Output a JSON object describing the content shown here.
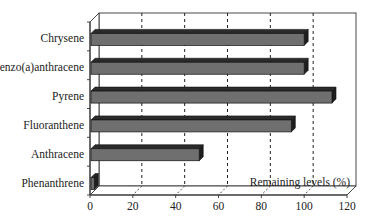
{
  "chart_data": {
    "type": "bar",
    "orientation": "horizontal",
    "style": "3d",
    "title": "",
    "categories": [
      "Chrysene",
      "Benzo(a)anthracene",
      "Pyrene",
      "Fluoranthene",
      "Anthracene",
      "Phenanthrene"
    ],
    "values": [
      100,
      100,
      113,
      94,
      51,
      2
    ],
    "xlabel": "Remaining levels (%)",
    "ylabel": "",
    "xlim": [
      0,
      120
    ],
    "xticks": [
      0,
      20,
      40,
      60,
      80,
      100,
      120
    ],
    "grid": "vertical dashed",
    "legend": null,
    "colors": {
      "bar_face": "#6f6f6f",
      "bar_top": "#2b2b2b",
      "bar_side": "#1e1e1e",
      "axis": "#333333",
      "grid": "#222222"
    }
  }
}
